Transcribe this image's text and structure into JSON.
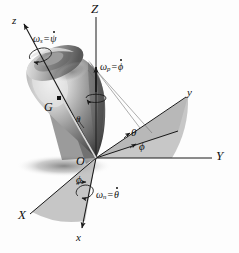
{
  "figure": {
    "background_color": "#fdfdfd",
    "line_color": "#1a1a1a",
    "sector_fill": "#b4b4b4",
    "body_colors": {
      "highlight": "#e8e8e8",
      "mid": "#9a9a9a",
      "shadow": "#4a4a4a"
    }
  },
  "axes": {
    "Z": "Z",
    "Y": "Y",
    "X": "X",
    "z": "z",
    "y": "y",
    "x": "x"
  },
  "points": {
    "origin": "O",
    "center_of_mass": "G"
  },
  "angles": {
    "theta_body": "θ",
    "theta_upper": "θ",
    "phi_upper": "ϕ",
    "phi_lower": "ϕ"
  },
  "rates": {
    "spin": {
      "symbol": "ω",
      "subscript": "s",
      "equals": "=",
      "value": "ψ",
      "dot": true,
      "name": "spin"
    },
    "precession": {
      "symbol": "ω",
      "subscript": "p",
      "equals": "=",
      "value": "ϕ",
      "dot": true,
      "name": "precession"
    },
    "nutation": {
      "symbol": "ω",
      "subscript": "n",
      "equals": "=",
      "value": "θ",
      "dot": true,
      "name": "nutation"
    }
  }
}
